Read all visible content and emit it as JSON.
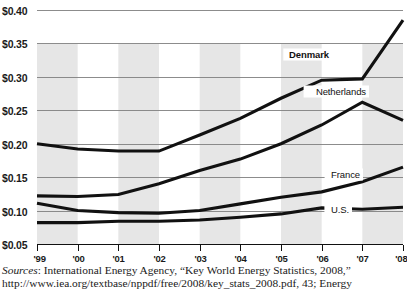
{
  "chart_data": {
    "type": "line",
    "title": "",
    "subtitle": "",
    "xlabel": "",
    "ylabel": "",
    "x": [
      "'99",
      "'00",
      "'01",
      "'02",
      "'03",
      "'04",
      "'05",
      "'06",
      "'07",
      "'08"
    ],
    "categories": [
      "'99",
      "'00",
      "'01",
      "'02",
      "'03",
      "'04",
      "'05",
      "'06",
      "'07",
      "'08"
    ],
    "xtick_labels": [
      "'99",
      "'00",
      "'01",
      "'02",
      "'03",
      "'04",
      "'05",
      "'06",
      "'07",
      "'08"
    ],
    "ytick_labels": [
      "$0.40",
      "$0.35",
      "$0.30",
      "$0.25",
      "$0.20",
      "$0.15",
      "$0.10",
      "$0.05"
    ],
    "ytick_values": [
      0.4,
      0.35,
      0.3,
      0.25,
      0.2,
      0.15,
      0.1,
      0.05
    ],
    "ylim": [
      0.04,
      0.405
    ],
    "xlim": [
      "'99",
      "'08"
    ],
    "grid": "horizontal",
    "legend": "inline-labels",
    "series": [
      {
        "name": "Denmark",
        "label": "Denmark",
        "emphasis": "bold",
        "values": [
          0.2,
          0.192,
          0.189,
          0.189,
          0.213,
          0.238,
          0.268,
          0.295,
          0.297,
          0.385
        ]
      },
      {
        "name": "Netherlands",
        "label": "Netherlands",
        "emphasis": "normal",
        "values": [
          0.122,
          0.121,
          0.124,
          0.14,
          0.16,
          0.177,
          0.2,
          0.228,
          0.262,
          0.235
        ]
      },
      {
        "name": "France",
        "label": "France",
        "emphasis": "normal",
        "values": [
          0.111,
          0.1,
          0.097,
          0.096,
          0.1,
          0.11,
          0.12,
          0.128,
          0.143,
          0.165
        ]
      },
      {
        "name": "U.S.",
        "label": "U.S.",
        "emphasis": "normal",
        "values": [
          0.082,
          0.082,
          0.084,
          0.084,
          0.086,
          0.09,
          0.095,
          0.104,
          0.102,
          0.105
        ]
      }
    ],
    "shaded_bands": true,
    "units": "USD per kilowatt-hour"
  },
  "source": {
    "lead_word": "Sources",
    "line1_rest": ": International Energy Agency, “Key World Energy Statistics, 2008,”",
    "line2": "http://www.iea.org/textbase/nppdf/free/2008/key_stats_2008.pdf, 43; Energy"
  },
  "colors": {
    "line": "#111111",
    "grid": "#808080",
    "band": "#dcdcdc",
    "text": "#1a1a1a",
    "background": "#ffffff"
  }
}
